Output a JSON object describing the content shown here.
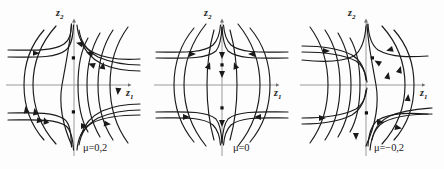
{
  "figure": {
    "background_color": "#fdfdfd",
    "curve_color": "#1a1a1a",
    "axis_color": "#9a9a9a",
    "fixed_point_color": "#111111"
  },
  "panels": [
    {
      "id": "panel-left",
      "parameter_label": "μ=0,2",
      "parameter_value": "0,2",
      "x_axis_label": "z",
      "x_axis_sub": "1",
      "y_axis_label": "z",
      "y_axis_sub": "2",
      "fixed_points": [
        {
          "x": 0,
          "y": 0.55
        },
        {
          "x": 0,
          "y": -0.55
        }
      ]
    },
    {
      "id": "panel-middle",
      "parameter_label": "μ=0",
      "parameter_value": "0",
      "x_axis_label": "z",
      "x_axis_sub": "1",
      "y_axis_label": "z",
      "y_axis_sub": "2",
      "fixed_points": [
        {
          "x": 0,
          "y": 0.55
        },
        {
          "x": 0,
          "y": -0.55
        }
      ]
    },
    {
      "id": "panel-right",
      "parameter_label": "μ=−0,2",
      "parameter_value": "−0,2",
      "x_axis_label": "z",
      "x_axis_sub": "1",
      "y_axis_label": "z",
      "y_axis_sub": "2",
      "fixed_points": [
        {
          "x": 0,
          "y": 0.55
        },
        {
          "x": 0,
          "y": -0.55
        }
      ]
    }
  ]
}
